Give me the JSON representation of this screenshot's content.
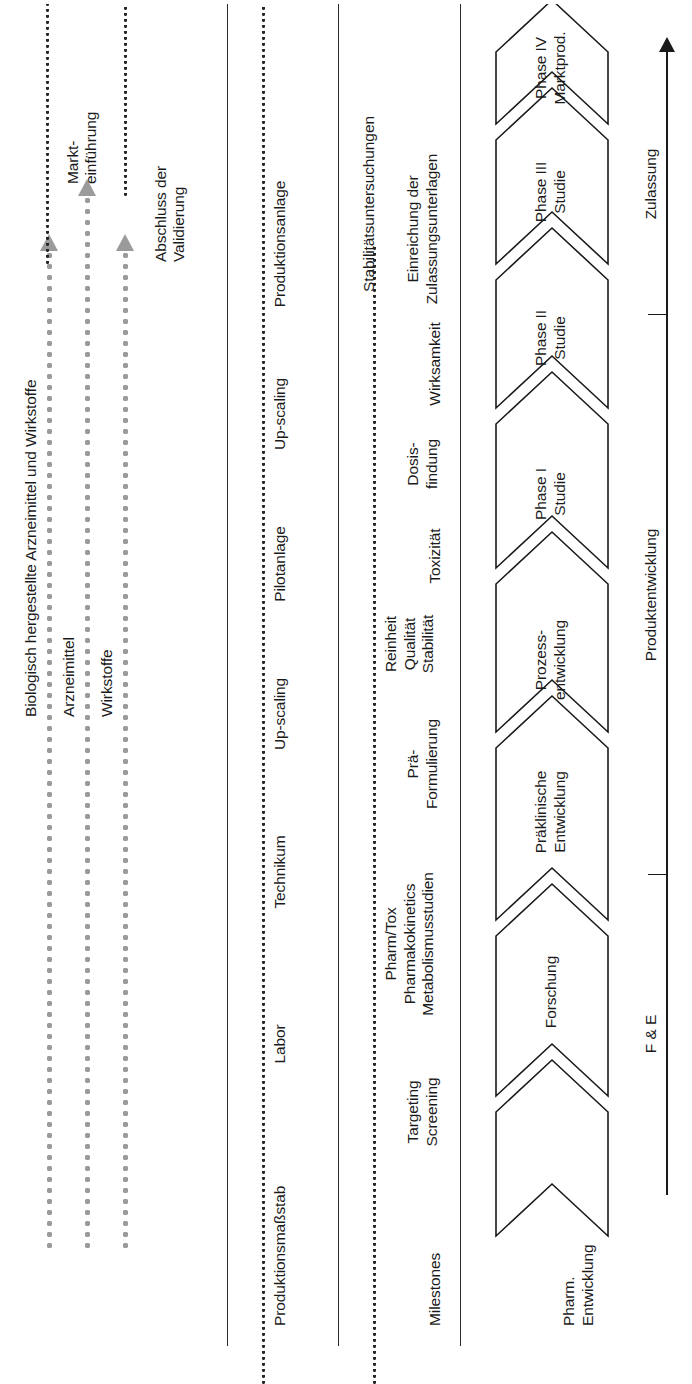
{
  "diagram": {
    "orientation": "rotated-90-ccw",
    "row_headers": {
      "milestones": "Milestones",
      "produktionsmassstab": "Produktionsmaßstab",
      "pharm_entwicklung": "Pharm.\nEntwicklung"
    },
    "arrow_tracks": [
      {
        "label": "Wirkstoffe"
      },
      {
        "label": "Arzneimittel"
      },
      {
        "label": "Biologisch hergestellte Arzneimittel und Wirkstoffe"
      }
    ],
    "track_annotations": [
      {
        "label": "Abschluss der\nValidierung"
      },
      {
        "label": "Markt-\neinführung"
      }
    ],
    "produktionsmassstab_stages": [
      "Labor",
      "Technikum",
      "Up-scaling",
      "Pilotanlage",
      "Up-scaling",
      "Produktionsanlage"
    ],
    "milestones": [
      "Targeting\nScreening",
      "Pharm/Tox\nPharmakokinetics\nMetabolismusstudien",
      "Prä-\nFormulierung",
      "Reinheit\nQualität\nStabilität",
      "Toxizität",
      "Dosis-\nfindung",
      "Wirksamkeit",
      "Stabilitätsuntersuchungen",
      "Einreichung der\nZulassungsunterlagen"
    ],
    "phases": [
      "Pharm.\nEntwicklung",
      "Forschung",
      "Präklinische\nEntwicklung",
      "Prozess-\nentwicklung",
      "Phase I\nStudie",
      "Phase II\nStudie",
      "Phase III\nStudie",
      "Phase IV\nMarktprod."
    ],
    "axis": {
      "label": "Zeitachse",
      "segments": [
        "F & E",
        "Produktentwicklung",
        "Zulassung"
      ]
    },
    "colors": {
      "ink": "#1a1a1a",
      "rule": "#2b2b2b",
      "track_grey": "#9b9b9b",
      "background": "#ffffff"
    }
  }
}
